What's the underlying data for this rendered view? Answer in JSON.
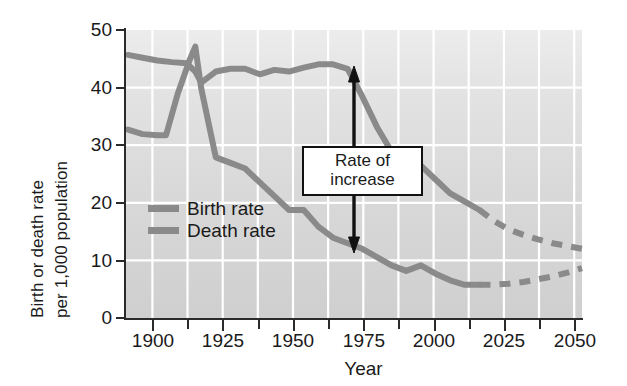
{
  "figure": {
    "ylabel_line1": "Birth or death rate",
    "ylabel_line2": "per 1,000 population",
    "xlabel": "Year"
  },
  "annotation": {
    "line1": "Rate of",
    "line2": "increase"
  },
  "legend": {
    "items": [
      {
        "label": "Birth rate",
        "color": "#8a8a8a"
      },
      {
        "label": "Death rate",
        "color": "#8a8a8a"
      }
    ]
  },
  "axis": {
    "y_ticks": [
      "50",
      "40",
      "30",
      "20",
      "10",
      "0"
    ],
    "x_ticks": [
      "1900",
      "1925",
      "1950",
      "1975",
      "2000",
      "2025",
      "2050"
    ]
  },
  "chart_data": {
    "type": "line",
    "title": "",
    "xlabel": "Year",
    "ylabel": "Birth or death rate per 1,000 population",
    "xlim": [
      1894,
      2050
    ],
    "ylim": [
      0,
      52
    ],
    "xticks": [
      1900,
      1925,
      1950,
      1975,
      2000,
      2025,
      2050
    ],
    "yticks": [
      0,
      10,
      20,
      30,
      40,
      50
    ],
    "grid": true,
    "grid_color": "#ffffff",
    "legend_position": "inside-lower-left",
    "annotations": [
      {
        "text": "Rate of increase",
        "type": "double-headed-arrow-with-box",
        "x": 1963,
        "y_top": 45.5,
        "y_bottom": 13.5
      }
    ],
    "series": [
      {
        "name": "Birth rate",
        "color": "#8a8a8a",
        "solid_until": 2015,
        "x": [
          1895,
          1900,
          1905,
          1910,
          1915,
          1918,
          1920,
          1925,
          1930,
          1935,
          1940,
          1945,
          1950,
          1955,
          1960,
          1965,
          1970,
          1972,
          1975,
          1980,
          1985,
          1990,
          1995,
          2000,
          2005,
          2010,
          2015,
          2020,
          2025,
          2030,
          2035,
          2040,
          2045,
          2050
        ],
        "y": [
          47.5,
          47.0,
          46.5,
          46.2,
          46.0,
          44.5,
          42.5,
          44.5,
          45.0,
          45.0,
          44.0,
          44.8,
          44.5,
          45.2,
          45.8,
          45.8,
          45.0,
          43.0,
          40.0,
          34.5,
          30.0,
          28.0,
          27.5,
          25.0,
          22.5,
          21.0,
          19.5,
          17.5,
          16.0,
          15.0,
          14.2,
          13.5,
          13.0,
          12.5
        ],
        "note": "Dashed from 2015 onward (projection)"
      },
      {
        "name": "Death rate",
        "color": "#8a8a8a",
        "solid_until": 2015,
        "x": [
          1895,
          1900,
          1905,
          1908,
          1912,
          1916,
          1918,
          1920,
          1925,
          1930,
          1935,
          1940,
          1945,
          1950,
          1955,
          1960,
          1965,
          1970,
          1975,
          1980,
          1985,
          1990,
          1995,
          2000,
          2005,
          2010,
          2015,
          2020,
          2025,
          2030,
          2035,
          2040,
          2045,
          2050
        ],
        "y": [
          34.0,
          33.2,
          33.0,
          33.0,
          40.5,
          46.5,
          49.0,
          41.5,
          29.0,
          28.0,
          27.0,
          24.5,
          22.0,
          19.5,
          19.5,
          16.5,
          14.5,
          13.5,
          12.5,
          11.0,
          9.5,
          8.5,
          9.5,
          8.0,
          6.8,
          6.0,
          6.0,
          6.0,
          6.2,
          6.5,
          7.0,
          7.5,
          8.2,
          9.0
        ],
        "note": "Spike to ~49 around 1918; dashed from 2015 onward (projection)"
      }
    ]
  }
}
